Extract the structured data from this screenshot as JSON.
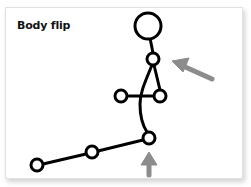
{
  "card": {
    "title": "Body flip"
  },
  "figure": {
    "stroke_color": "#000000",
    "fill_color": "#ffffff",
    "arrow_color": "#8c8c8c",
    "head": {
      "cx": 148,
      "cy": 26,
      "r": 13
    },
    "joints": [
      {
        "name": "neck",
        "cx": 153,
        "cy": 59,
        "r": 6
      },
      {
        "name": "left-hand",
        "cx": 121,
        "cy": 96,
        "r": 6
      },
      {
        "name": "right-hand",
        "cx": 160,
        "cy": 96,
        "r": 6
      },
      {
        "name": "hip",
        "cx": 149,
        "cy": 138,
        "r": 6
      },
      {
        "name": "knee",
        "cx": 92,
        "cy": 152,
        "r": 6
      },
      {
        "name": "foot",
        "cx": 37,
        "cy": 165,
        "r": 6
      }
    ]
  },
  "arrows": [
    {
      "name": "side-arrow",
      "direction": "up-left",
      "points_to": "neck"
    },
    {
      "name": "bottom-arrow",
      "direction": "up",
      "points_to": "hip"
    }
  ]
}
